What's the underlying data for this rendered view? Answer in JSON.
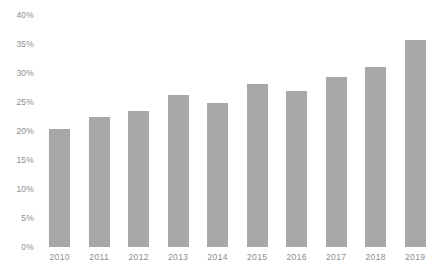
{
  "chart_data": {
    "type": "bar",
    "title": "",
    "subtitle": "",
    "xlabel": "",
    "ylabel": "",
    "categories": [
      "2010",
      "2011",
      "2012",
      "2013",
      "2014",
      "2015",
      "2016",
      "2017",
      "2018",
      "2019"
    ],
    "values": [
      20.3,
      22.4,
      23.5,
      26.2,
      24.8,
      28.1,
      26.9,
      29.3,
      31.0,
      35.7
    ],
    "ylim": [
      0,
      40
    ],
    "y_ticks": [
      0,
      5,
      10,
      15,
      20,
      25,
      30,
      35,
      40
    ],
    "y_tick_labels": [
      "0%",
      "5%",
      "10%",
      "15%",
      "20%",
      "25%",
      "30%",
      "35%",
      "40%"
    ],
    "grid": false,
    "legend": null,
    "legend_position": "none",
    "annotations": [],
    "series": [
      {
        "name": "",
        "color": "#a8a8a8",
        "values": [
          20.3,
          22.4,
          23.5,
          26.2,
          24.8,
          28.1,
          26.9,
          29.3,
          31.0,
          35.7
        ]
      }
    ]
  },
  "colors": {
    "bar": "#a8a8a8",
    "axis_text": "#8c8c8c",
    "background": "#ffffff"
  }
}
